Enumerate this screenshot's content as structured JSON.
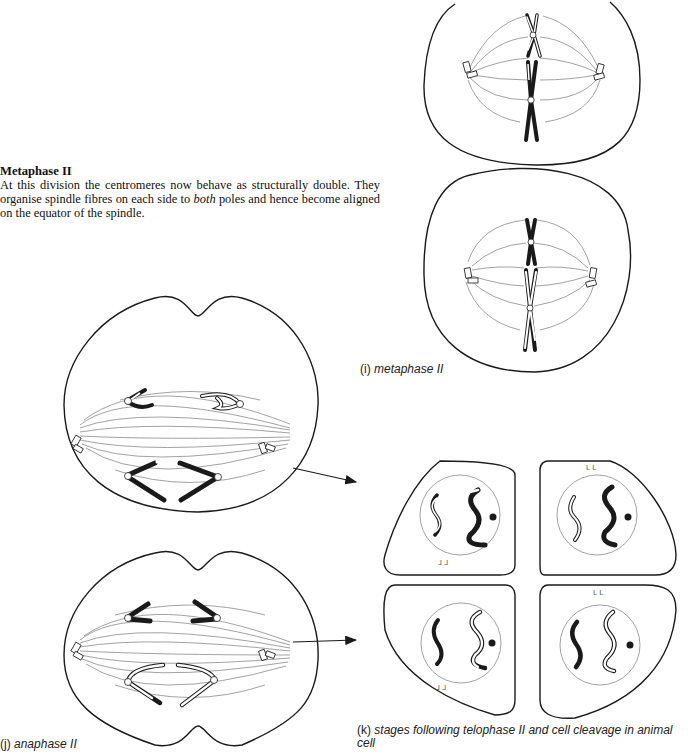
{
  "section": {
    "heading": "Metaphase II",
    "body_before": "At this division the centromeres now behave as structurally double. They organise spindle fibres on each side to ",
    "body_emph": "both",
    "body_after": " poles and hence become aligned on the equator of the spindle."
  },
  "figures": {
    "i": {
      "label": "(i)",
      "title": "metaphase II"
    },
    "j": {
      "label": "(j)",
      "title": "anaphase II"
    },
    "k": {
      "label": "(k)",
      "title": "stages following telophase II and cell cleavage in animal",
      "title_line2": "cell"
    }
  },
  "colors": {
    "ink": "#1a1a1a",
    "fibre": "#8a8a8a",
    "paper": "#ffffff"
  }
}
